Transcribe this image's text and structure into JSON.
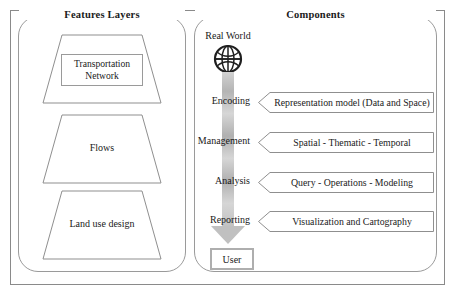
{
  "diagram": {
    "panels": {
      "features": {
        "title": "Features Layers",
        "layers": [
          {
            "label": "Transportation Network",
            "boxed": true
          },
          {
            "label": "Flows",
            "boxed": false
          },
          {
            "label": "Land use design",
            "boxed": false
          }
        ]
      },
      "components": {
        "title": "Components",
        "source": {
          "label": "Real World",
          "icon": "globe-icon"
        },
        "stages": [
          {
            "label": "Encoding",
            "banner": "Representation model (Data and Space)"
          },
          {
            "label": "Management",
            "banner": "Spatial - Thematic - Temporal"
          },
          {
            "label": "Analysis",
            "banner": "Query - Operations - Modeling"
          },
          {
            "label": "Reporting",
            "banner": "Visualization and Cartography"
          }
        ],
        "target": {
          "label": "User"
        }
      }
    },
    "colors": {
      "frame": "#8a8a8a",
      "panel_border": "#9a9a9a",
      "arrow_gray": "#c0c0c0",
      "user_box_border": "#aeaeae",
      "text": "#1a1a1a"
    }
  }
}
